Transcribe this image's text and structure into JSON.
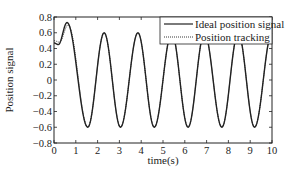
{
  "chart_data": {
    "type": "line",
    "title": "",
    "xlabel": "time(s)",
    "ylabel": "Position signal",
    "xlim": [
      0,
      10
    ],
    "ylim": [
      -0.8,
      0.8
    ],
    "xticks": [
      0,
      1,
      2,
      3,
      4,
      5,
      6,
      7,
      8,
      9,
      10
    ],
    "yticks": [
      -0.8,
      -0.6,
      -0.4,
      -0.2,
      0,
      0.2,
      0.4,
      0.6,
      0.8
    ],
    "ytick_labels": [
      "−0.8",
      "−0.6",
      "−0.4",
      "−0.2",
      "0",
      "0.2",
      "0.4",
      "0.6",
      "0.8"
    ],
    "grid": false,
    "legend_position": "upper right",
    "series": [
      {
        "name": "Ideal position signal",
        "style": "solid",
        "color": "#222222",
        "description": "Sinusoid amplitude ~0.6, period ~1.55 s; initial transient rising from ~0.47 to peak ~0.73 at t≈0.6 s",
        "x": [
          0,
          0.2,
          0.6,
          1.55,
          2.3,
          3.05,
          3.85,
          4.6,
          5.4,
          6.15,
          6.9,
          7.7,
          8.45,
          9.2,
          10
        ],
        "values": [
          0.47,
          0.45,
          0.73,
          -0.6,
          0.6,
          -0.6,
          0.6,
          -0.6,
          0.6,
          -0.6,
          0.6,
          -0.6,
          0.6,
          -0.6,
          0.6
        ]
      },
      {
        "name": "Position tracking",
        "style": "dotted",
        "color": "#222222",
        "description": "Tracks ideal signal closely; slight lag/deviation in first 0.6 s",
        "x": [
          0,
          0.25,
          0.65,
          1.55,
          2.3,
          3.05,
          3.85,
          4.6,
          5.4,
          6.15,
          6.9,
          7.7,
          8.45,
          9.2,
          10
        ],
        "values": [
          0.5,
          0.48,
          0.7,
          -0.6,
          0.6,
          -0.6,
          0.6,
          -0.6,
          0.6,
          -0.6,
          0.6,
          -0.6,
          0.6,
          -0.6,
          0.6
        ]
      }
    ]
  },
  "legend": {
    "items": [
      {
        "label": "Ideal position signal",
        "style": "solid"
      },
      {
        "label": "Position tracking",
        "style": "dotted"
      }
    ]
  },
  "axes": {
    "xlabel": "time(s)",
    "ylabel": "Position signal"
  }
}
